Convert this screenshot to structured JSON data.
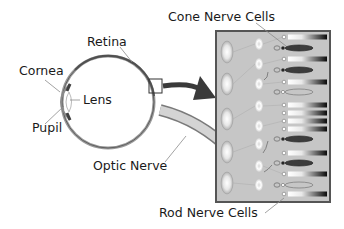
{
  "diagram": {
    "labels": {
      "cone_nerve_cells": "Cone Nerve Cells",
      "retina": "Retina",
      "cornea": "Cornea",
      "lens": "Lens",
      "pupil": "Pupil",
      "optic_nerve": "Optic Nerve",
      "rod_nerve_cells": "Rod Nerve Cells"
    },
    "colors": {
      "panel_bg": "#c8c8c8",
      "panel_border": "#555555",
      "eye_outline": "#6a6a6a",
      "arrow": "#3a3a3a",
      "cone_fill": "#3c3c3c"
    },
    "receptor_rows": [
      {
        "y": 37,
        "type": "rod"
      },
      {
        "y": 48,
        "type": "cone"
      },
      {
        "y": 59,
        "type": "rod"
      },
      {
        "y": 70,
        "type": "cone"
      },
      {
        "y": 82,
        "type": "rod"
      },
      {
        "y": 92,
        "type": "cone-outline"
      },
      {
        "y": 105,
        "type": "rod"
      },
      {
        "y": 113,
        "type": "rod"
      },
      {
        "y": 121,
        "type": "rod"
      },
      {
        "y": 129,
        "type": "rod"
      },
      {
        "y": 139,
        "type": "cone"
      },
      {
        "y": 153,
        "type": "rod"
      },
      {
        "y": 163,
        "type": "cone"
      },
      {
        "y": 174,
        "type": "rod"
      },
      {
        "y": 185,
        "type": "cone-outline"
      },
      {
        "y": 194,
        "type": "rod"
      }
    ]
  }
}
